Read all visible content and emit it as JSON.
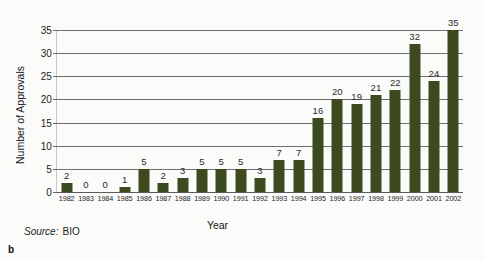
{
  "figure": {
    "panel_label": "b",
    "source_word": "Source:",
    "source_value": "BIO",
    "bar_color": "#3d4a20",
    "grid_color": "#6e6e6e",
    "background_color": "#fbfbf9"
  },
  "chart_data": {
    "type": "bar",
    "title": "",
    "subtitle": "",
    "xlabel": "Year",
    "ylabel": "Number of Approvals",
    "categories": [
      "1982",
      "1983",
      "1984",
      "1985",
      "1986",
      "1987",
      "1988",
      "1989",
      "1990",
      "1991",
      "1992",
      "1993",
      "1994",
      "1995",
      "1996",
      "1997",
      "1998",
      "1999",
      "2000",
      "2001",
      "2002"
    ],
    "values": [
      2,
      0,
      0,
      1,
      5,
      2,
      3,
      5,
      5,
      5,
      3,
      7,
      7,
      16,
      20,
      19,
      21,
      22,
      32,
      24,
      35
    ],
    "data_labels": [
      "2",
      "0",
      "0",
      "1",
      "5",
      "2",
      "3",
      "5",
      "5",
      "5",
      "3",
      "7",
      "7",
      "16",
      "20",
      "19",
      "21",
      "22",
      "32",
      "24",
      "35"
    ],
    "yticks": [
      0,
      5,
      10,
      15,
      20,
      25,
      30,
      35
    ],
    "ytick_labels": [
      "0",
      "5",
      "10",
      "15",
      "20",
      "25",
      "30",
      "35"
    ],
    "ylim": [
      0,
      35
    ],
    "grid": "horizontal",
    "legend": "none",
    "annotations": [
      "Source: BIO",
      "b"
    ]
  }
}
